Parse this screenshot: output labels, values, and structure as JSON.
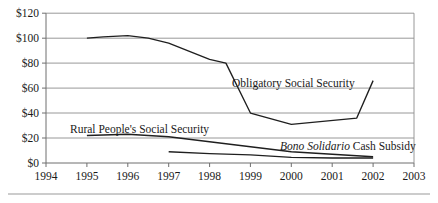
{
  "chart_data": {
    "type": "line",
    "title": "",
    "subtitle": "",
    "xlabel": "",
    "ylabel": "",
    "xlim": [
      1994,
      2003
    ],
    "ylim": [
      0,
      120
    ],
    "grid": true,
    "legend_position": "inline-annotations",
    "y_ticks": [
      0,
      20,
      40,
      60,
      80,
      100,
      120
    ],
    "y_tick_labels": [
      "$0",
      "$20",
      "$40",
      "$60",
      "$80",
      "$100",
      "$120"
    ],
    "x_ticks": [
      1994,
      1995,
      1996,
      1997,
      1998,
      1999,
      2000,
      2001,
      2002,
      2003
    ],
    "x_tick_labels": [
      "1994",
      "1995",
      "1996",
      "1997",
      "1998",
      "1999",
      "2000",
      "2001",
      "2002",
      "2003"
    ],
    "series": [
      {
        "name": "Obligatory Social Security",
        "label_text_plain": "Obligatory Social Security",
        "label_prefix_italic": "",
        "label_rest": "Obligatory Social Security",
        "x": [
          1995,
          1995.4,
          1996,
          1996.5,
          1997,
          1998,
          1998.4,
          1999,
          2000,
          2001.6,
          2002
        ],
        "values": [
          100,
          101,
          102,
          100,
          96,
          83,
          80,
          40,
          31,
          36,
          66
        ]
      },
      {
        "name": "Rural People's Social Security",
        "label_text_plain": "Rural People's Social Security",
        "label_prefix_italic": "",
        "label_rest": "Rural People's Social Security",
        "x": [
          1995,
          1996,
          1997,
          1998,
          1999,
          2000,
          2001,
          2002
        ],
        "values": [
          22,
          23,
          21,
          17,
          13,
          9,
          7,
          5
        ]
      },
      {
        "name": "Bono Solidario Cash Subsidy",
        "label_text_plain": "Bono Solidario Cash Subsidy",
        "label_prefix_italic": "Bono Solidario",
        "label_rest": " Cash Subsidy",
        "x": [
          1997,
          1998,
          1999,
          2000,
          2001,
          2002
        ],
        "values": [
          9,
          7.5,
          6.5,
          4.5,
          4,
          4
        ]
      }
    ],
    "annotations": [
      {
        "id": "annotation-obligatory",
        "text": "Obligatory Social Security",
        "x_px": 232,
        "y_px": 87
      },
      {
        "id": "annotation-rural",
        "text": "Rural People's Social Security",
        "x_px": 70,
        "y_px": 133
      },
      {
        "id": "annotation-bono",
        "text": "Bono Solidario Cash Subsidy",
        "x_px": 280,
        "y_px": 150
      }
    ]
  }
}
